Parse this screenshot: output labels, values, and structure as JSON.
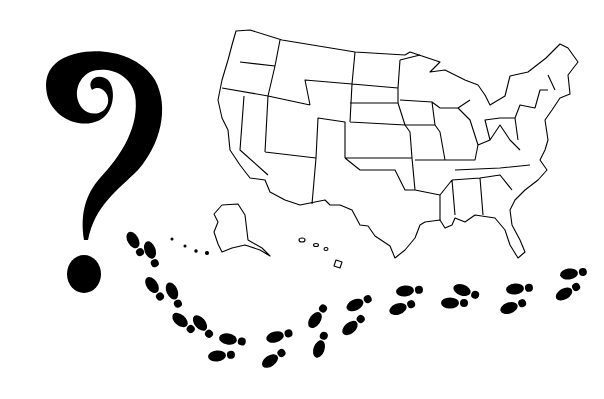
{
  "illustration": {
    "description": "Question mark beside an outline map of the United States with a trail of footprints",
    "elements": {
      "question_mark": {
        "icon": "question-mark-icon",
        "color": "#000000"
      },
      "map": {
        "icon": "usa-map-outline-icon",
        "stroke": "#000000",
        "fill": "#ffffff"
      },
      "footprints": {
        "icon": "footprint-trail-icon",
        "color": "#000000",
        "count": 26
      }
    }
  }
}
